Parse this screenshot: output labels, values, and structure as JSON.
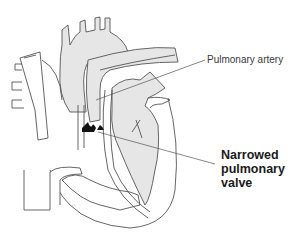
{
  "diagram": {
    "colors": {
      "outline": "#555555",
      "chamber_fill": "#e6e6e6",
      "valve_fill": "#111111",
      "background": "#ffffff"
    },
    "labels": {
      "pulmonary_artery": "Pulmonary artery",
      "narrowed_valve_line1": "Narrowed",
      "narrowed_valve_line2": "pulmonary",
      "narrowed_valve_line3": "valve"
    }
  }
}
